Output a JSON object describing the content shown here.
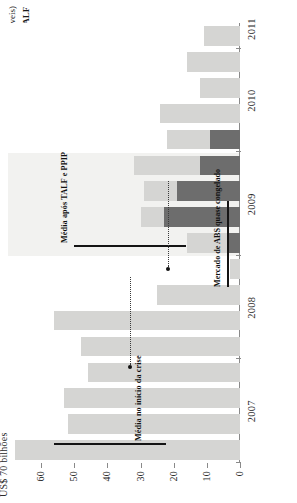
{
  "chart_data": {
    "type": "bar",
    "title": "",
    "xlabel": "",
    "ylabel": "US$ 70 bilhões",
    "unit_label": "US$ 70 bilhões",
    "ylim": [
      0,
      70
    ],
    "yticks": [
      "0",
      "10",
      "20",
      "30",
      "40",
      "50",
      "60"
    ],
    "ytick_values": [
      0,
      10,
      20,
      30,
      40,
      50,
      60
    ],
    "grid": false,
    "legend_position": "top-right",
    "categories": [
      "2007 Q1",
      "2007 Q2",
      "2007 Q3",
      "2007 Q4",
      "2008 Q1",
      "2008 Q2",
      "2008 Q3",
      "2008 Q4",
      "2009 Q1",
      "2009 Q2",
      "2009 Q3",
      "2009 Q4",
      "2010 Q1",
      "2010 Q2",
      "2010 Q3",
      "2010 Q4",
      "2011 Q1"
    ],
    "xtick_labels": [
      "2007",
      "2008",
      "2009",
      "2010",
      "2011"
    ],
    "series": [
      {
        "name": "Emissão total (classes elegíveis)",
        "color": "#d5d5d3",
        "values": [
          68,
          52,
          53,
          46,
          48,
          56,
          25,
          3,
          16,
          30,
          29,
          32,
          22,
          24,
          12,
          16,
          11
        ]
      },
      {
        "name": "Quantia empenhada na TALF",
        "color": "#6d6d6d",
        "values": [
          0,
          0,
          0,
          0,
          0,
          0,
          0,
          0,
          4,
          23,
          19,
          12,
          9,
          0,
          0,
          0,
          0
        ]
      }
    ],
    "annotations": [
      {
        "name": "lehman-note",
        "bold_lead": "Falência do Lehman",
        "text": " Depois do colapso da instituição em setembro de 2008, o mercado de ABS ficou quase congelado"
      },
      {
        "name": "talf-note",
        "bold_lead": "A TALF",
        "text": ", que se torna operacional em março de 2009, tem o efeito imediato de restaurar a função do mercado"
      },
      {
        "name": "ppip-note",
        "bold_lead": "O PPIP",
        "text": ", introduzido em fevereiro de 2009, também dá apoio ao mercado"
      }
    ],
    "rules": [
      {
        "name": "avg-start-crisis",
        "label": "Média no início da crise",
        "value": 53
      },
      {
        "name": "avg-after-talf-ppip",
        "label": "Média após TALF e PPIP",
        "value": 30
      }
    ],
    "callouts": [
      {
        "name": "frozen-abs-market",
        "label": "Mercado de ABS quase congelado"
      }
    ]
  },
  "legend": {
    "items": [
      {
        "label": "Emissão total (classes elegíveis)",
        "color": "#d5d5d3",
        "bold": false
      },
      {
        "label": "Quantia empenhada na TALF",
        "color": "#6d6d6d",
        "bold": true
      }
    ]
  }
}
